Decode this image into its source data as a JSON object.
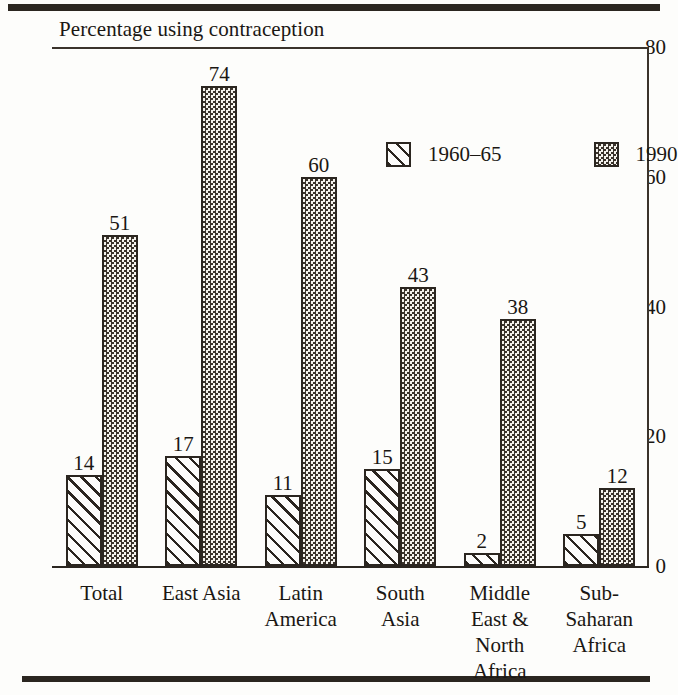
{
  "chart_data": {
    "type": "bar",
    "title": "Percentage using contraception",
    "xlabel": "",
    "ylabel": "",
    "ylim": [
      0,
      80
    ],
    "yticks": [
      0,
      20,
      40,
      60,
      80
    ],
    "grid": false,
    "legend_position": "inside-top-right",
    "categories": [
      "Total",
      "East Asia",
      "Latin\nAmerica",
      "South\nAsia",
      "Middle\nEast &\nNorth\nAfrica",
      "Sub-\nSaharan\nAfrica"
    ],
    "series": [
      {
        "name": "1960–65",
        "pattern": "diagonal-hatch",
        "values": [
          14,
          17,
          11,
          15,
          2,
          5
        ]
      },
      {
        "name": "1990",
        "pattern": "checkerboard",
        "values": [
          51,
          74,
          60,
          43,
          38,
          12
        ]
      }
    ]
  },
  "axis": {
    "y_tick_labels": [
      "0",
      "20",
      "40",
      "60",
      "80"
    ]
  },
  "legend": {
    "entries": [
      {
        "label": "1960–65",
        "swatch": "diagonal-hatch-swatch"
      },
      {
        "label": "1990",
        "swatch": "checkerboard-swatch"
      }
    ]
  },
  "colors": {
    "ink": "#2b2620",
    "paper": "#fdfdfb",
    "fill_1990": "#e8e6e0"
  }
}
